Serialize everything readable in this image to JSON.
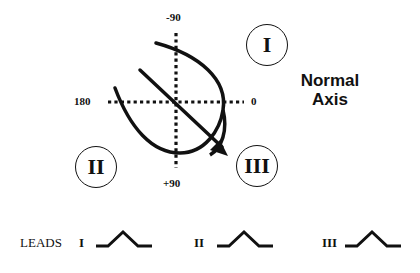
{
  "diagram": {
    "title_line1": "Normal",
    "title_line2": "Axis",
    "axis_labels": {
      "top": "-90",
      "bottom": "+90",
      "left": "180",
      "right": "0"
    },
    "lead_circles": [
      {
        "label": "I"
      },
      {
        "label": "II"
      },
      {
        "label": "III"
      }
    ],
    "leads_row": {
      "label": "LEADS",
      "leads": [
        {
          "name": "I",
          "deflection": "positive"
        },
        {
          "name": "II",
          "deflection": "positive"
        },
        {
          "name": "III",
          "deflection": "positive"
        }
      ]
    },
    "colors": {
      "ink": "#111111",
      "background": "#ffffff"
    }
  }
}
